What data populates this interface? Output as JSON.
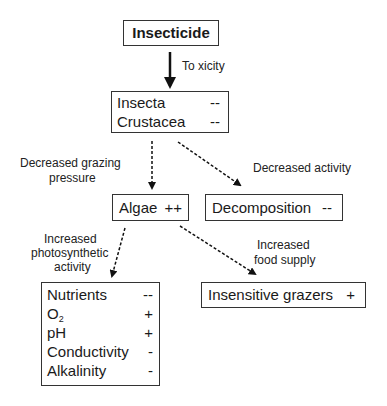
{
  "nodes": {
    "insecticide": {
      "label": "Insecticide"
    },
    "insects": {
      "rows": [
        {
          "name": "Insecta",
          "effect": "--"
        },
        {
          "name": "Crustacea",
          "effect": "--"
        }
      ]
    },
    "algae": {
      "name": "Algae",
      "effect": "++"
    },
    "decomposition": {
      "name": "Decomposition",
      "effect": "--"
    },
    "water_quality": {
      "rows": [
        {
          "name": "Nutrients",
          "effect": "--"
        },
        {
          "name": "O",
          "sub": "2",
          "effect": "+"
        },
        {
          "name": "pH",
          "effect": "+"
        },
        {
          "name": "Conductivity",
          "effect": "-"
        },
        {
          "name": "Alkalinity",
          "effect": "-"
        }
      ]
    },
    "grazers": {
      "name": "Insensitive grazers",
      "effect": "+"
    }
  },
  "edges": {
    "toxicity": "To xicity",
    "grazing_1": "Decreased grazing",
    "grazing_2": "pressure",
    "decreased_activity": "Decreased activity",
    "photo_1": "Increased",
    "photo_2": "photosynthetic",
    "photo_3": "activity",
    "food_1": "Increased",
    "food_2": "food supply"
  }
}
